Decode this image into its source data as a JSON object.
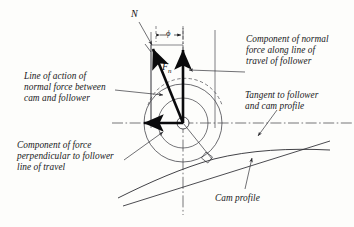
{
  "figure": {
    "background_color": "#fdfdfb",
    "line_color": "#2b2b30",
    "bold_vector_color": "#0a0a0c"
  },
  "symbols": {
    "normal_line_symbol": "N",
    "force_symbol": "F",
    "force_subscript": "n",
    "pressure_angle_symbol": "ϕ"
  },
  "annotations": {
    "normal_force_component_along_travel": "Component of normal\nforce along line of\ntravel of follower",
    "line_of_action": "Line of action of\nnormal force between\ncam and follower",
    "tangent": "Tangent to follower\nand cam profile",
    "perpendicular_component": "Component of force\nperpendicular to follower\nline of travel",
    "cam_profile": "Cam profile"
  },
  "geometry": {
    "follower_center": [
      183,
      123
    ],
    "follower_outer_radius": 39,
    "follower_inner_radius": 25,
    "hub_radius": 6,
    "vector_tail": [
      183,
      123
    ],
    "normal_force_head": [
      151,
      52
    ],
    "vertical_component_head": [
      183,
      53
    ],
    "horizontal_component_head": [
      141,
      123
    ],
    "contact_point": [
      212,
      158
    ]
  }
}
